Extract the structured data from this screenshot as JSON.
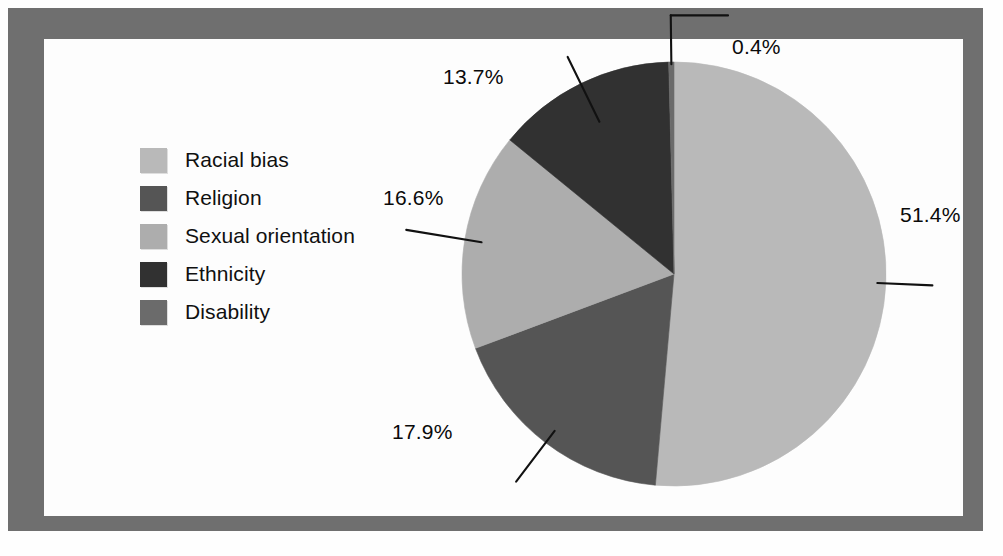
{
  "figure": {
    "frame_color": "#6f6f6f",
    "background_color": "#fdfdfd"
  },
  "legend": {
    "items": [
      {
        "label": "Racial bias",
        "color": "#b9b9b9"
      },
      {
        "label": "Religion",
        "color": "#555555"
      },
      {
        "label": "Sexual orientation",
        "color": "#adadad"
      },
      {
        "label": "Ethnicity",
        "color": "#313131"
      },
      {
        "label": "Disability",
        "color": "#6b6b6b"
      }
    ]
  },
  "labels": {
    "racial_bias": "51.4%",
    "religion": "17.9%",
    "sexual_orientation": "16.6%",
    "ethnicity": "13.7%",
    "disability": "0.4%"
  },
  "chart_data": {
    "type": "pie",
    "title": "",
    "subtitle": "",
    "xlabel": "",
    "ylabel": "",
    "legend_position": "left",
    "grid": false,
    "start_angle_deg": 0,
    "direction": "clockwise",
    "unit": "%",
    "categories": [
      "Racial bias",
      "Religion",
      "Sexual orientation",
      "Ethnicity",
      "Disability"
    ],
    "values": [
      51.4,
      17.9,
      16.6,
      13.7,
      0.4
    ],
    "colors": [
      "#b9b9b9",
      "#555555",
      "#adadad",
      "#313131",
      "#6b6b6b"
    ],
    "data_labels": [
      "51.4%",
      "17.9%",
      "16.6%",
      "13.7%",
      "0.4%"
    ],
    "slices": [
      {
        "name": "Racial bias",
        "value": 51.4,
        "label": "51.4%",
        "color": "#b9b9b9"
      },
      {
        "name": "Religion",
        "value": 17.9,
        "label": "17.9%",
        "color": "#555555"
      },
      {
        "name": "Sexual orientation",
        "value": 16.6,
        "label": "16.6%",
        "color": "#adadad"
      },
      {
        "name": "Ethnicity",
        "value": 13.7,
        "label": "13.7%",
        "color": "#313131"
      },
      {
        "name": "Disability",
        "value": 0.4,
        "label": "0.4%",
        "color": "#6b6b6b"
      }
    ],
    "total": 100.0
  }
}
